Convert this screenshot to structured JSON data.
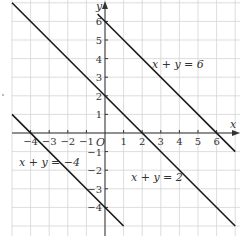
{
  "chart_data": {
    "type": "line",
    "title": "",
    "xlabel": "x",
    "ylabel": "y",
    "origin_label": "O",
    "xlim": [
      -5,
      7
    ],
    "ylim": [
      -5.4,
      7
    ],
    "grid": true,
    "x_ticks": [
      -4,
      -3,
      -2,
      -1,
      1,
      2,
      3,
      4,
      5,
      6
    ],
    "y_ticks": [
      -4,
      -3,
      -2,
      -1,
      1,
      2,
      3,
      4,
      5,
      6
    ],
    "series": [
      {
        "name": "x + y = 6",
        "equation": "x + y = 6",
        "points": [
          [
            -0.4,
            6.4
          ],
          [
            7,
            -1
          ]
        ],
        "label_pos": [
          2.0,
          4.0
        ]
      },
      {
        "name": "x + y = 2",
        "equation": "x + y = 2",
        "points": [
          [
            -5,
            7
          ],
          [
            7,
            -5
          ]
        ],
        "label_pos": [
          1.2,
          -2.3
        ]
      },
      {
        "name": "x + y = -4",
        "equation": "x + y = -4",
        "points": [
          [
            -5,
            1
          ],
          [
            1,
            -5
          ]
        ],
        "label_pos": [
          -4.9,
          -1.5
        ]
      }
    ]
  },
  "labels": {
    "line1": "x + y = 6",
    "line2": "x + y = 2",
    "line3": "x + y = −4",
    "x_axis": "x",
    "y_axis": "y",
    "origin": "O"
  },
  "colors": {
    "line": "#1a1a1a",
    "grid": "#d4d4d4",
    "axis": "#333333"
  }
}
